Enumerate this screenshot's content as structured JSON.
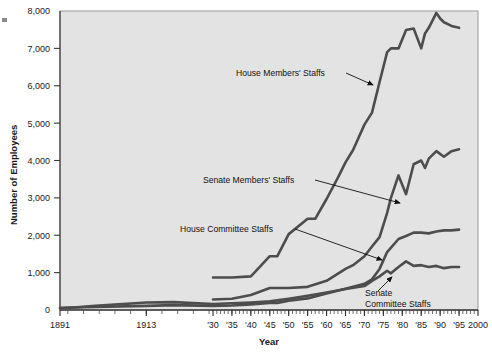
{
  "chart_data": {
    "type": "line",
    "title": "",
    "xlabel": "Year",
    "ylabel": "Number of Employees",
    "xlim": [
      1891,
      2000
    ],
    "ylim": [
      0,
      8000
    ],
    "grid": false,
    "legend_position": "inline-annotations",
    "y_ticks": [
      0,
      1000,
      2000,
      3000,
      4000,
      5000,
      6000,
      7000,
      8000
    ],
    "y_tick_labels": [
      "0",
      "1,000",
      "2,000",
      "3,000",
      "4,000",
      "5,000",
      "6,000",
      "7,000",
      "8,000"
    ],
    "x_ticks": [
      1891,
      1913,
      1930,
      1935,
      1940,
      1945,
      1950,
      1955,
      1960,
      1965,
      1970,
      1975,
      1980,
      1985,
      1990,
      1995,
      2000
    ],
    "x_tick_labels": [
      "1891",
      "1913",
      "'30",
      "'35",
      "'40",
      "'45",
      "'50",
      "'55",
      "'60",
      "'65",
      "'70",
      "'75",
      "'80",
      "'85",
      "'90",
      "'95",
      "2000"
    ],
    "plot_background": "#e3e3e3",
    "line_color": "#4d4d4d",
    "series": [
      {
        "name": "House Members' Staffs",
        "x": [
          1930,
          1935,
          1940,
          1945,
          1947,
          1950,
          1955,
          1957,
          1960,
          1963,
          1965,
          1967,
          1970,
          1972,
          1974,
          1976,
          1977,
          1979,
          1981,
          1983,
          1985,
          1986,
          1987,
          1989,
          1990,
          1991,
          1993,
          1995
        ],
        "y": [
          870,
          870,
          900,
          1440,
          1440,
          2030,
          2440,
          2440,
          2970,
          3540,
          3950,
          4280,
          4960,
          5280,
          6100,
          6900,
          7000,
          7000,
          7490,
          7530,
          7000,
          7400,
          7550,
          7950,
          7800,
          7700,
          7600,
          7550
        ]
      },
      {
        "name": "Senate Members' Staffs",
        "x": [
          1930,
          1935,
          1940,
          1945,
          1950,
          1955,
          1960,
          1965,
          1967,
          1970,
          1972,
          1974,
          1976,
          1977,
          1979,
          1981,
          1983,
          1985,
          1986,
          1987,
          1989,
          1991,
          1993,
          1995
        ],
        "y": [
          280,
          300,
          400,
          590,
          590,
          620,
          780,
          1100,
          1200,
          1440,
          1700,
          1950,
          2600,
          3000,
          3600,
          3100,
          3900,
          4000,
          3800,
          4050,
          4250,
          4100,
          4250,
          4300
        ]
      },
      {
        "name": "House Committee Staffs",
        "x": [
          1891,
          1900,
          1913,
          1920,
          1930,
          1935,
          1940,
          1945,
          1947,
          1950,
          1955,
          1960,
          1965,
          1970,
          1972,
          1974,
          1976,
          1979,
          1981,
          1983,
          1985,
          1987,
          1989,
          1991,
          1993,
          1995
        ],
        "y": [
          60,
          80,
          110,
          130,
          110,
          120,
          150,
          190,
          190,
          250,
          310,
          440,
          570,
          700,
          820,
          1100,
          1550,
          1900,
          1980,
          2070,
          2070,
          2050,
          2100,
          2130,
          2130,
          2150
        ]
      },
      {
        "name": "Senate Committee Staffs",
        "x": [
          1891,
          1900,
          1913,
          1920,
          1930,
          1935,
          1940,
          1945,
          1950,
          1955,
          1960,
          1965,
          1970,
          1972,
          1974,
          1976,
          1977,
          1979,
          1981,
          1983,
          1985,
          1987,
          1989,
          1991,
          1993,
          1995
        ],
        "y": [
          40,
          110,
          200,
          210,
          160,
          180,
          200,
          230,
          300,
          380,
          470,
          560,
          640,
          780,
          900,
          1050,
          980,
          1150,
          1300,
          1180,
          1200,
          1150,
          1180,
          1120,
          1150,
          1150
        ]
      }
    ],
    "annotations": [
      {
        "text": "House Members' Staffs",
        "label_x": 236,
        "label_y": 73,
        "arrow_from_x": 346,
        "arrow_from_y": 73,
        "arrow_to_x": 373,
        "arrow_to_y": 85
      },
      {
        "text": "Senate Members' Staffs",
        "label_x": 203,
        "label_y": 180,
        "arrow_from_x": 315,
        "arrow_from_y": 180,
        "arrow_to_x": 400,
        "arrow_to_y": 203
      },
      {
        "text": "House Committee Staffs",
        "label_x": 180,
        "label_y": 229,
        "arrow_from_x": 295,
        "arrow_from_y": 229,
        "arrow_to_x": 382,
        "arrow_to_y": 260
      },
      {
        "text": "Senate Committee Staffs",
        "line1": "Senate",
        "line2": "Committee Staffs",
        "label_x": 365,
        "label_y": 296,
        "arrow_from_x": 378,
        "arrow_from_y": 291,
        "arrow_to_x": 392,
        "arrow_to_y": 277
      }
    ]
  }
}
